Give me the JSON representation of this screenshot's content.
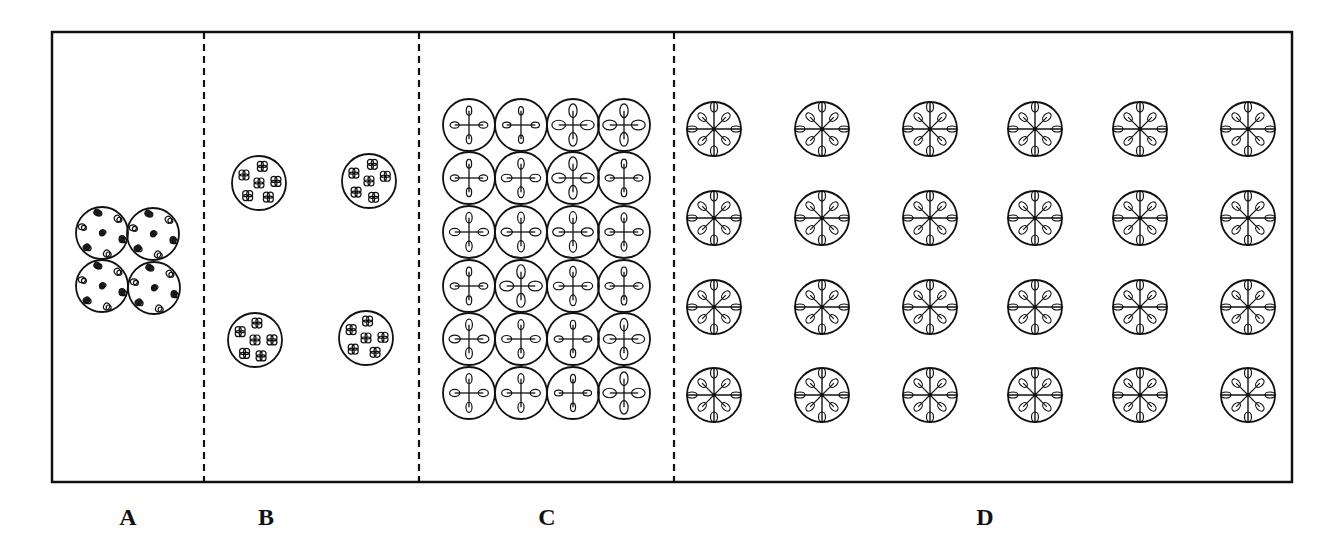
{
  "figure": {
    "frame": {
      "left": 52,
      "top": 32,
      "right": 1292,
      "bottom": 482,
      "stroke": "#111111"
    },
    "dividers": [
      204,
      419,
      674
    ],
    "panels": [
      {
        "id": "A",
        "label": "A",
        "label_x": 128,
        "arrangement": "2x2 touching",
        "cell_type": "dots",
        "circle_radius": 26,
        "circles": [
          [
            102,
            233
          ],
          [
            153,
            234
          ],
          [
            102,
            286
          ],
          [
            154,
            288
          ]
        ]
      },
      {
        "id": "B",
        "label": "B",
        "label_x": 266,
        "arrangement": "2x2 spaced",
        "cell_type": "clusters",
        "circle_radius": 27,
        "circles": [
          [
            259,
            183
          ],
          [
            369,
            181
          ],
          [
            255,
            340
          ],
          [
            366,
            338
          ]
        ]
      },
      {
        "id": "C",
        "label": "C",
        "label_x": 547,
        "arrangement": "4 columns x 6 rows touching",
        "cell_type": "cross4",
        "circle_radius": 26,
        "cols": [
          469,
          521,
          573,
          624
        ],
        "rows": [
          125,
          178,
          232,
          286,
          339,
          393
        ]
      },
      {
        "id": "D",
        "label": "D",
        "label_x": 985,
        "arrangement": "6 columns x 4 rows spaced",
        "cell_type": "star8",
        "circle_radius": 27,
        "cols": [
          714,
          822,
          930,
          1035,
          1140,
          1248
        ],
        "rows": [
          129,
          218,
          307,
          395
        ]
      }
    ]
  }
}
